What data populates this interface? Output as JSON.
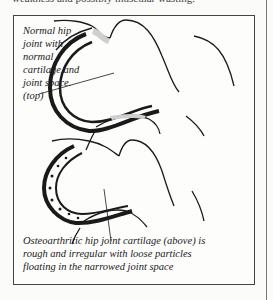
{
  "page": {
    "top_text": "weakness and possibly muscular wasting."
  },
  "figure": {
    "caption_top_lines": [
      "Normal hip",
      "joint with",
      "normal",
      "cartilage and",
      "joint space.",
      "(top)"
    ],
    "caption_bottom_lines": [
      "Osteoarthritic hip joint cartilage (above) is",
      "rough and irregular with loose particles",
      "floating in the narrowed joint space"
    ]
  }
}
